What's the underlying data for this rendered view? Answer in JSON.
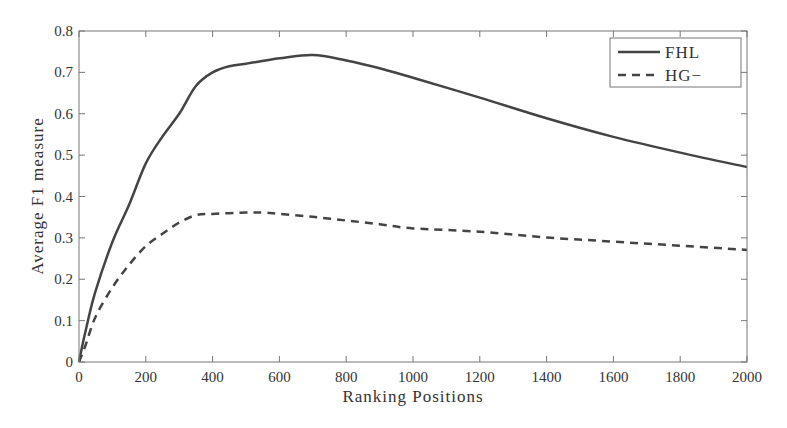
{
  "chart_data": {
    "type": "line",
    "title": "",
    "xlabel": "Ranking Positions",
    "ylabel": "Average F1 measure",
    "xlim": [
      0,
      2000
    ],
    "ylim": [
      0,
      0.8
    ],
    "xticks": [
      0,
      200,
      400,
      600,
      800,
      1000,
      1200,
      1400,
      1600,
      1800,
      2000
    ],
    "yticks": [
      0,
      0.1,
      0.2,
      0.3,
      0.4,
      0.5,
      0.6,
      0.7,
      0.8
    ],
    "ytick_labels": [
      "0",
      "0.1",
      "0.2",
      "0.3",
      "0.4",
      "0.5",
      "0.6",
      "0.7",
      "0.8"
    ],
    "grid": false,
    "legend_position": "upper right",
    "series": [
      {
        "name": "FHL",
        "style": "solid",
        "color": "#444444",
        "x": [
          0,
          18,
          48,
          100,
          150,
          200,
          250,
          300,
          350,
          400,
          450,
          500,
          600,
          700,
          800,
          900,
          1000,
          1200,
          1400,
          1600,
          1800,
          2000
        ],
        "values": [
          0,
          0.069,
          0.167,
          0.29,
          0.38,
          0.48,
          0.545,
          0.6,
          0.667,
          0.7,
          0.715,
          0.721,
          0.734,
          0.742,
          0.729,
          0.71,
          0.687,
          0.639,
          0.589,
          0.544,
          0.506,
          0.471
        ]
      },
      {
        "name": "HG−",
        "style": "dashed",
        "color": "#444444",
        "x": [
          0,
          18,
          50,
          100,
          150,
          200,
          250,
          300,
          350,
          400,
          500,
          550,
          600,
          700,
          800,
          900,
          1000,
          1200,
          1400,
          1600,
          1800,
          2000
        ],
        "values": [
          0,
          0.037,
          0.11,
          0.18,
          0.235,
          0.28,
          0.31,
          0.337,
          0.355,
          0.358,
          0.361,
          0.361,
          0.358,
          0.351,
          0.342,
          0.333,
          0.323,
          0.315,
          0.301,
          0.291,
          0.281,
          0.271
        ]
      }
    ]
  },
  "legend": {
    "items": [
      {
        "label": "FHL"
      },
      {
        "label": "HG−"
      }
    ]
  }
}
